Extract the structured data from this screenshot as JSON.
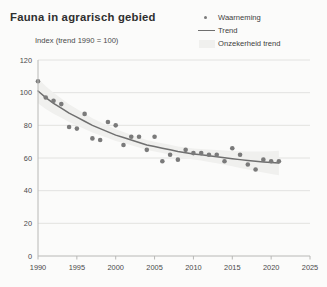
{
  "header": {
    "title": "Fauna in agrarisch gebied",
    "subtitle": "Index (trend 1990 = 100)"
  },
  "legend": {
    "position": "top-right",
    "items": [
      {
        "label": "Waarneming",
        "marker": "dot",
        "color": "#7a7a7a",
        "icon": "scatter-dot-icon"
      },
      {
        "label": "Trend",
        "marker": "line",
        "color": "#6f6f6f",
        "icon": "trend-line-icon"
      },
      {
        "label": "Onzekerheid trend",
        "marker": "band",
        "color": "#f0f0ee",
        "icon": "uncertainty-band-icon"
      }
    ]
  },
  "chart_data": {
    "type": "scatter",
    "title": "Fauna in agrarisch gebied",
    "subtitle": "Index (trend 1990 = 100)",
    "xlabel": "",
    "ylabel": "Index (trend 1990 = 100)",
    "xlim": [
      1990,
      2025
    ],
    "ylim": [
      0,
      120
    ],
    "xticks": [
      1990,
      1995,
      2000,
      2005,
      2010,
      2015,
      2020,
      2025
    ],
    "yticks": [
      0,
      20,
      40,
      60,
      80,
      100,
      120
    ],
    "grid": "horizontal",
    "colors": {
      "point": "#7a7a7a",
      "trend": "#6f6f6f",
      "band": "#f0f0ee",
      "grid": "#e2e2e0",
      "axis": "#b8b8b6",
      "background": "#fbfbfa"
    },
    "series": [
      {
        "name": "Waarneming",
        "type": "scatter",
        "x": [
          1990,
          1991,
          1992,
          1993,
          1994,
          1995,
          1996,
          1997,
          1998,
          1999,
          2000,
          2001,
          2002,
          2003,
          2004,
          2005,
          2006,
          2007,
          2008,
          2009,
          2010,
          2011,
          2012,
          2013,
          2014,
          2015,
          2016,
          2017,
          2018,
          2019,
          2020,
          2021
        ],
        "values": [
          107,
          97,
          95,
          93,
          79,
          78,
          87,
          72,
          71,
          82,
          80,
          68,
          73,
          73,
          65,
          73,
          58,
          62,
          59,
          65,
          63,
          63,
          62,
          62,
          58,
          66,
          62,
          56,
          53,
          59,
          58,
          58
        ]
      },
      {
        "name": "Trend",
        "type": "line",
        "x": [
          1990,
          1991,
          1992,
          1993,
          1994,
          1995,
          1996,
          1997,
          1998,
          1999,
          2000,
          2001,
          2002,
          2003,
          2004,
          2005,
          2006,
          2007,
          2008,
          2009,
          2010,
          2011,
          2012,
          2013,
          2014,
          2015,
          2016,
          2017,
          2018,
          2019,
          2020,
          2021
        ],
        "values": [
          101,
          97,
          93.5,
          90.5,
          87.5,
          85,
          82.5,
          80,
          78,
          76,
          74,
          72.5,
          71,
          69.5,
          68,
          67,
          66,
          65,
          64,
          63.2,
          62.5,
          62,
          61.4,
          60.8,
          60.2,
          59.6,
          59,
          58.5,
          58,
          57.6,
          57.2,
          57
        ]
      }
    ]
  }
}
